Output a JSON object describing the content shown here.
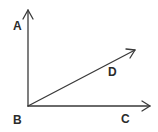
{
  "diagram": {
    "type": "angle-rays",
    "vertex": {
      "label": "B",
      "x": 28,
      "y": 106
    },
    "rays": [
      {
        "name": "BA",
        "label": "A",
        "end": {
          "x": 28,
          "y": 10
        }
      },
      {
        "name": "BD",
        "label": "D",
        "end": {
          "x": 135,
          "y": 50
        }
      },
      {
        "name": "BC",
        "label": "C",
        "end": {
          "x": 150,
          "y": 106
        }
      }
    ],
    "labels": {
      "A": "A",
      "B": "B",
      "C": "C",
      "D": "D"
    },
    "colors": {
      "line": "#3a3a3a",
      "text": "#2b2b2b",
      "background": "#ffffff"
    }
  }
}
